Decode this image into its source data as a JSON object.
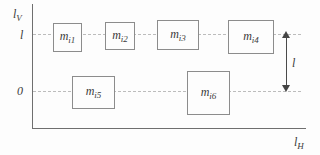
{
  "figure": {
    "y_axis_label": {
      "base": "l",
      "sub": "V"
    },
    "x_axis_label": {
      "base": "l",
      "sub": "H"
    },
    "tick_upper": "l",
    "tick_lower": "0",
    "arrow_label": "l",
    "boxes": [
      {
        "base": "m",
        "sub": "i1"
      },
      {
        "base": "m",
        "sub": "i2"
      },
      {
        "base": "m",
        "sub": "i3"
      },
      {
        "base": "m",
        "sub": "i4"
      },
      {
        "base": "m",
        "sub": "i5"
      },
      {
        "base": "m",
        "sub": "i6"
      }
    ],
    "colors": {
      "background": "#fdfdfd",
      "axis": "#6f6f6f",
      "dashed_line": "#bcbcbc",
      "box_border": "#8c8c8c",
      "text": "#3a3a3a",
      "arrow": "#444444"
    }
  }
}
